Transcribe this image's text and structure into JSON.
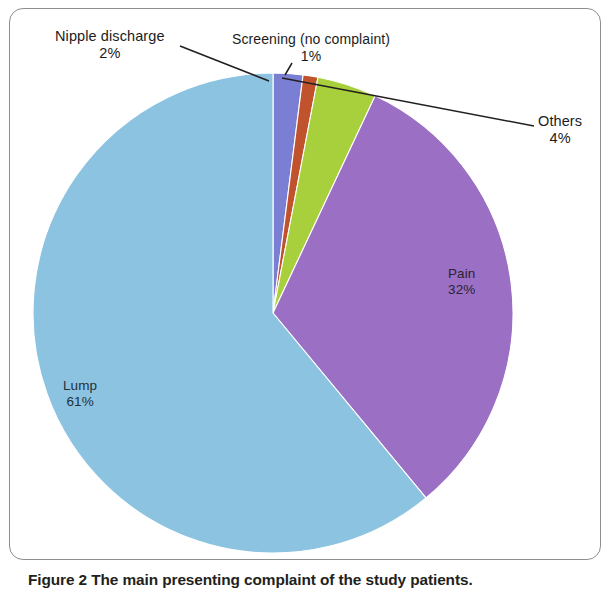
{
  "figure": {
    "caption_label": "Figure 2",
    "caption_text": "The main presenting complaint of the study patients."
  },
  "chart_data": {
    "type": "pie",
    "title": "",
    "labels": [
      "Nipple discharge",
      "Screening (no complaint)",
      "Others",
      "Pain",
      "Lump"
    ],
    "values": [
      2,
      1,
      4,
      32,
      61
    ],
    "value_unit": "%",
    "legend": "none",
    "start_angle_deg": 0,
    "direction": "clockwise",
    "colors": [
      "#7b7fd4",
      "#c0522d",
      "#a8d03c",
      "#9b6fc4",
      "#8cc3e0"
    ],
    "slices": [
      {
        "name": "Nipple discharge",
        "value": 2,
        "display_value": "2%",
        "color": "#7b7fd4",
        "label_placement": "outside-leader"
      },
      {
        "name": "Screening (no complaint)",
        "value": 1,
        "display_value": "1%",
        "color": "#c0522d",
        "label_placement": "outside-leader"
      },
      {
        "name": "Others",
        "value": 4,
        "display_value": "4%",
        "color": "#a8d03c",
        "label_placement": "outside-leader"
      },
      {
        "name": "Pain",
        "value": 32,
        "display_value": "32%",
        "color": "#9b6fc4",
        "label_placement": "inside"
      },
      {
        "name": "Lump",
        "value": 61,
        "display_value": "61%",
        "color": "#8cc3e0",
        "label_placement": "inside"
      }
    ]
  },
  "labels": {
    "nipple": {
      "name": "Nipple discharge",
      "pct": "2%"
    },
    "screening": {
      "name": "Screening (no complaint)",
      "pct": "1%"
    },
    "others": {
      "name": "Others",
      "pct": "4%"
    },
    "pain": {
      "name": "Pain",
      "pct": "32%"
    },
    "lump": {
      "name": "Lump",
      "pct": "61%"
    }
  }
}
